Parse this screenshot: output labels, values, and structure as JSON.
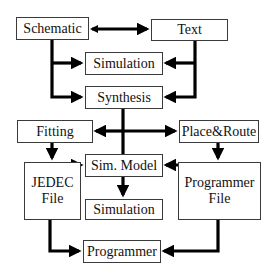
{
  "diagram": {
    "type": "flowchart",
    "nodes": {
      "schematic": "Schematic",
      "text": "Text",
      "simulation_top": "Simulation",
      "synthesis": "Synthesis",
      "fitting": "Fitting",
      "place_route": "Place&Route",
      "sim_model": "Sim. Model",
      "jedec_file": "JEDEC\nFile",
      "simulation_bottom": "Simulation",
      "programmer_file": "Programmer\nFile",
      "programmer": "Programmer"
    },
    "edges": [
      {
        "from": "schematic",
        "to": "text",
        "bidirectional": true
      },
      {
        "from": "schematic",
        "to": "simulation_top"
      },
      {
        "from": "schematic",
        "to": "synthesis"
      },
      {
        "from": "text",
        "to": "simulation_top"
      },
      {
        "from": "text",
        "to": "synthesis"
      },
      {
        "from": "synthesis",
        "to": "fitting"
      },
      {
        "from": "synthesis",
        "to": "place_route"
      },
      {
        "from": "fitting",
        "to": "sim_model"
      },
      {
        "from": "fitting",
        "to": "jedec_file"
      },
      {
        "from": "place_route",
        "to": "sim_model"
      },
      {
        "from": "place_route",
        "to": "programmer_file"
      },
      {
        "from": "sim_model",
        "to": "simulation_bottom"
      },
      {
        "from": "jedec_file",
        "to": "programmer"
      },
      {
        "from": "programmer_file",
        "to": "programmer"
      }
    ]
  }
}
